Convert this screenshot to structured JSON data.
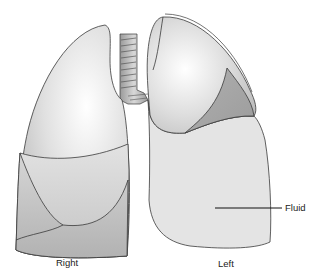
{
  "figure": {
    "labels": {
      "right": "Right",
      "left": "Left",
      "fluid": "Fluid"
    },
    "colors": {
      "outline": "#3a3a3a",
      "lung_light": "#e6e6e6",
      "lung_mid": "#cfcfcf",
      "lung_dark": "#aaaaaa",
      "fluid": "#e4e4e4",
      "trachea": "#b8b8b8"
    }
  }
}
